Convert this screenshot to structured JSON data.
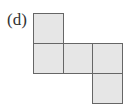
{
  "figure": {
    "label": "(d)",
    "fill_color": "#e6e6e6",
    "border_color": "#666666",
    "squares": [
      {
        "row": 0,
        "col": 0
      },
      {
        "row": 1,
        "col": 0
      },
      {
        "row": 1,
        "col": 1
      },
      {
        "row": 1,
        "col": 2
      },
      {
        "row": 2,
        "col": 2
      }
    ]
  }
}
